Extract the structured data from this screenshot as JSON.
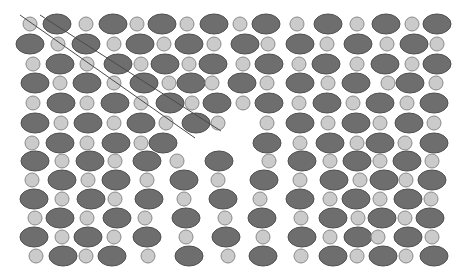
{
  "diagram": {
    "title": "",
    "colors": {
      "background": "#ffffff",
      "large_atom_fill": "#6e6e6e",
      "large_atom_stroke": "#4f4f4f",
      "small_atom_fill": "#cbcbcb",
      "small_atom_stroke": "#8a8a8a",
      "line": "#4a4a4a"
    },
    "sizes": {
      "large_rx": 14,
      "large_ry": 10,
      "small_r": 7
    },
    "rows": [
      {
        "y": 24,
        "atoms": [
          [
            "s",
            30
          ],
          [
            "b",
            57
          ],
          [
            "s",
            86
          ],
          [
            "b",
            113
          ],
          [
            "s",
            137
          ],
          [
            "b",
            162
          ],
          [
            "s",
            187
          ],
          [
            "b",
            214
          ],
          [
            "s",
            240
          ],
          [
            "b",
            266
          ],
          [
            "s",
            297
          ],
          [
            "b",
            328
          ],
          [
            "s",
            357
          ],
          [
            "b",
            386
          ],
          [
            "s",
            412
          ],
          [
            "b",
            437
          ]
        ]
      },
      {
        "y": 44,
        "atoms": [
          [
            "b",
            30
          ],
          [
            "s",
            58
          ],
          [
            "b",
            86
          ],
          [
            "s",
            114
          ],
          [
            "b",
            140
          ],
          [
            "s",
            164
          ],
          [
            "b",
            189
          ],
          [
            "s",
            214
          ],
          [
            "b",
            245
          ],
          [
            "s",
            268
          ],
          [
            "b",
            300
          ],
          [
            "s",
            327
          ],
          [
            "b",
            358
          ],
          [
            "s",
            387
          ],
          [
            "b",
            414
          ],
          [
            "s",
            437
          ]
        ]
      },
      {
        "y": 64,
        "atoms": [
          [
            "s",
            33
          ],
          [
            "b",
            60
          ],
          [
            "s",
            87
          ],
          [
            "b",
            118
          ],
          [
            "s",
            141
          ],
          [
            "b",
            165
          ],
          [
            "s",
            189
          ],
          [
            "b",
            213
          ],
          [
            "s",
            243
          ],
          [
            "b",
            269
          ],
          [
            "s",
            299
          ],
          [
            "b",
            326
          ],
          [
            "s",
            357
          ],
          [
            "b",
            385
          ],
          [
            "s",
            412
          ],
          [
            "b",
            437
          ]
        ]
      },
      {
        "y": 83,
        "atoms": [
          [
            "b",
            35
          ],
          [
            "s",
            60
          ],
          [
            "b",
            87
          ],
          [
            "s",
            114
          ],
          [
            "b",
            144
          ],
          [
            "s",
            169
          ],
          [
            "b",
            191
          ],
          [
            "s",
            212
          ],
          [
            "b",
            242
          ],
          [
            "s",
            267
          ],
          [
            "b",
            300
          ],
          [
            "s",
            328
          ],
          [
            "b",
            356
          ],
          [
            "s",
            388
          ],
          [
            "b",
            410
          ],
          [
            "s",
            436
          ]
        ]
      },
      {
        "y": 103,
        "atoms": [
          [
            "s",
            33
          ],
          [
            "b",
            61
          ],
          [
            "s",
            87
          ],
          [
            "b",
            115
          ],
          [
            "s",
            141
          ],
          [
            "b",
            170
          ],
          [
            "s",
            192
          ],
          [
            "b",
            217
          ],
          [
            "s",
            243
          ],
          [
            "b",
            269
          ],
          [
            "s",
            299
          ],
          [
            "b",
            327
          ],
          [
            "s",
            353
          ],
          [
            "b",
            380
          ],
          [
            "s",
            407
          ],
          [
            "b",
            434
          ]
        ]
      },
      {
        "y": 123,
        "atoms": [
          [
            "b",
            35
          ],
          [
            "s",
            61
          ],
          [
            "b",
            88
          ],
          [
            "s",
            114
          ],
          [
            "b",
            141
          ],
          [
            "s",
            166
          ],
          [
            "b",
            196
          ],
          [
            "s",
            218
          ],
          [
            "s",
            267
          ],
          [
            "b",
            300
          ],
          [
            "s",
            328
          ],
          [
            "b",
            356
          ],
          [
            "s",
            380
          ],
          [
            "b",
            409
          ],
          [
            "s",
            434
          ]
        ]
      },
      {
        "y": 143,
        "atoms": [
          [
            "s",
            32
          ],
          [
            "b",
            60
          ],
          [
            "s",
            87
          ],
          [
            "b",
            116
          ],
          [
            "s",
            141
          ],
          [
            "b",
            163
          ],
          [
            "b",
            267
          ],
          [
            "s",
            300
          ],
          [
            "b",
            330
          ],
          [
            "s",
            357
          ],
          [
            "b",
            380
          ],
          [
            "s",
            405
          ],
          [
            "b",
            434
          ]
        ]
      },
      {
        "y": 161,
        "atoms": [
          [
            "b",
            35
          ],
          [
            "s",
            62
          ],
          [
            "b",
            90
          ],
          [
            "s",
            115
          ],
          [
            "b",
            147
          ],
          [
            "s",
            177
          ],
          [
            "b",
            219
          ],
          [
            "s",
            269
          ],
          [
            "b",
            302
          ],
          [
            "s",
            330
          ],
          [
            "b",
            357
          ],
          [
            "s",
            380
          ],
          [
            "b",
            407
          ],
          [
            "s",
            432
          ]
        ]
      },
      {
        "y": 180,
        "atoms": [
          [
            "s",
            32
          ],
          [
            "b",
            62
          ],
          [
            "s",
            88
          ],
          [
            "b",
            116
          ],
          [
            "s",
            147
          ],
          [
            "b",
            184
          ],
          [
            "s",
            218
          ],
          [
            "b",
            264
          ],
          [
            "s",
            300
          ],
          [
            "b",
            334
          ],
          [
            "s",
            360
          ],
          [
            "b",
            384
          ],
          [
            "s",
            406
          ],
          [
            "b",
            432
          ]
        ]
      },
      {
        "y": 199,
        "atoms": [
          [
            "b",
            34
          ],
          [
            "s",
            62
          ],
          [
            "b",
            91
          ],
          [
            "s",
            115
          ],
          [
            "b",
            149
          ],
          [
            "s",
            184
          ],
          [
            "b",
            223
          ],
          [
            "s",
            260
          ],
          [
            "b",
            300
          ],
          [
            "s",
            330
          ],
          [
            "b",
            356
          ],
          [
            "s",
            380
          ],
          [
            "b",
            408
          ],
          [
            "s",
            431
          ]
        ]
      },
      {
        "y": 218,
        "atoms": [
          [
            "s",
            35
          ],
          [
            "b",
            60
          ],
          [
            "s",
            87
          ],
          [
            "b",
            117
          ],
          [
            "s",
            145
          ],
          [
            "b",
            186
          ],
          [
            "s",
            225
          ],
          [
            "b",
            262
          ],
          [
            "s",
            301
          ],
          [
            "b",
            333
          ],
          [
            "s",
            358
          ],
          [
            "b",
            382
          ],
          [
            "s",
            405
          ],
          [
            "b",
            430
          ]
        ]
      },
      {
        "y": 237,
        "atoms": [
          [
            "b",
            34
          ],
          [
            "s",
            62
          ],
          [
            "b",
            88
          ],
          [
            "s",
            114
          ],
          [
            "b",
            147
          ],
          [
            "s",
            186
          ],
          [
            "b",
            226
          ],
          [
            "s",
            263
          ],
          [
            "b",
            302
          ],
          [
            "s",
            330
          ],
          [
            "b",
            358
          ],
          [
            "s",
            378
          ],
          [
            "b",
            408
          ],
          [
            "s",
            432
          ]
        ]
      },
      {
        "y": 256,
        "atoms": [
          [
            "s",
            36
          ],
          [
            "b",
            63
          ],
          [
            "s",
            86
          ],
          [
            "b",
            112
          ],
          [
            "s",
            148
          ],
          [
            "b",
            189
          ],
          [
            "s",
            228
          ],
          [
            "b",
            263
          ],
          [
            "s",
            301
          ],
          [
            "b",
            333
          ],
          [
            "s",
            357
          ],
          [
            "b",
            383
          ],
          [
            "s",
            406
          ],
          [
            "b",
            434
          ]
        ]
      }
    ],
    "lines": [
      {
        "name": "slip-line-upper",
        "x1": 40,
        "y1": 15,
        "x2": 221,
        "y2": 131
      },
      {
        "name": "slip-line-lower",
        "x1": 20,
        "y1": 15,
        "x2": 195,
        "y2": 138
      }
    ]
  }
}
